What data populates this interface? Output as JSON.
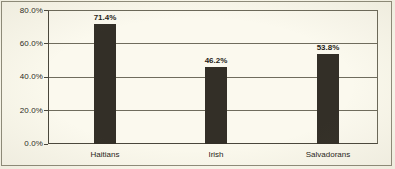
{
  "chart_data": {
    "type": "bar",
    "title": "",
    "subtitle": "",
    "xlabel": "",
    "ylabel": "",
    "categories": [
      "Haitians",
      "Irish",
      "Salvadorans"
    ],
    "values": [
      71.4,
      46.2,
      53.8
    ],
    "data_labels": [
      "71.4%",
      "46.2%",
      "53.8%"
    ],
    "ylim": [
      0,
      80
    ],
    "ytick_values": [
      0,
      20,
      40,
      60,
      80
    ],
    "ytick_labels": [
      "0.0%",
      "20.0%",
      "40.0%",
      "60.0%",
      "80.0%"
    ],
    "grid": true,
    "legend": "none",
    "series": [
      {
        "name": "",
        "values": [
          71.4,
          46.2,
          53.8
        ]
      }
    ]
  },
  "style": {
    "background_color": "#faf8ec",
    "bar_color": "#332f27",
    "gridline_color": "#6f6c5d",
    "axis_color": "#4a473c",
    "frame_color": "#8e8b7a",
    "text_color": "#1f1d18"
  }
}
